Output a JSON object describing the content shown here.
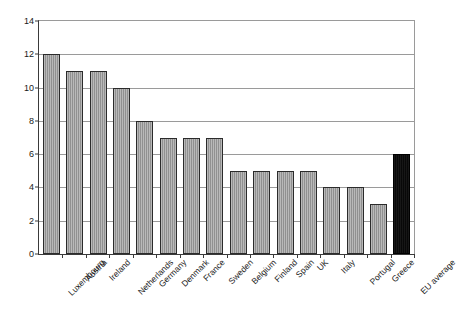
{
  "chart_data": {
    "type": "bar",
    "title": "",
    "subtitle": "",
    "xlabel": "",
    "ylabel": "",
    "ylim": [
      0,
      14
    ],
    "ytick_step": 2,
    "yticks": [
      0,
      2,
      4,
      6,
      8,
      10,
      12,
      14
    ],
    "grid": true,
    "legend": false,
    "legend_position": "none",
    "categories": [
      "Luxembourg",
      "Austria",
      "Ireland",
      "Netherlands",
      "Germany",
      "Denmark",
      "France",
      "Sweden",
      "Belgium",
      "Finland",
      "Spain",
      "UK",
      "Italy",
      "Portugal",
      "Greece",
      "EU average"
    ],
    "values": [
      12,
      11,
      11,
      10,
      8,
      7,
      7,
      7,
      5,
      5,
      5,
      5,
      4,
      4,
      3,
      6
    ],
    "highlight_index": 15,
    "colors": {
      "bar": "#9b9b9b",
      "bar_border": "#2b2b2b",
      "highlight_bar": "#0b0b0b",
      "gridline": "#9a9a9a",
      "axis": "#3a3a3a",
      "text": "#1a1a1a",
      "background": "#ffffff"
    }
  }
}
